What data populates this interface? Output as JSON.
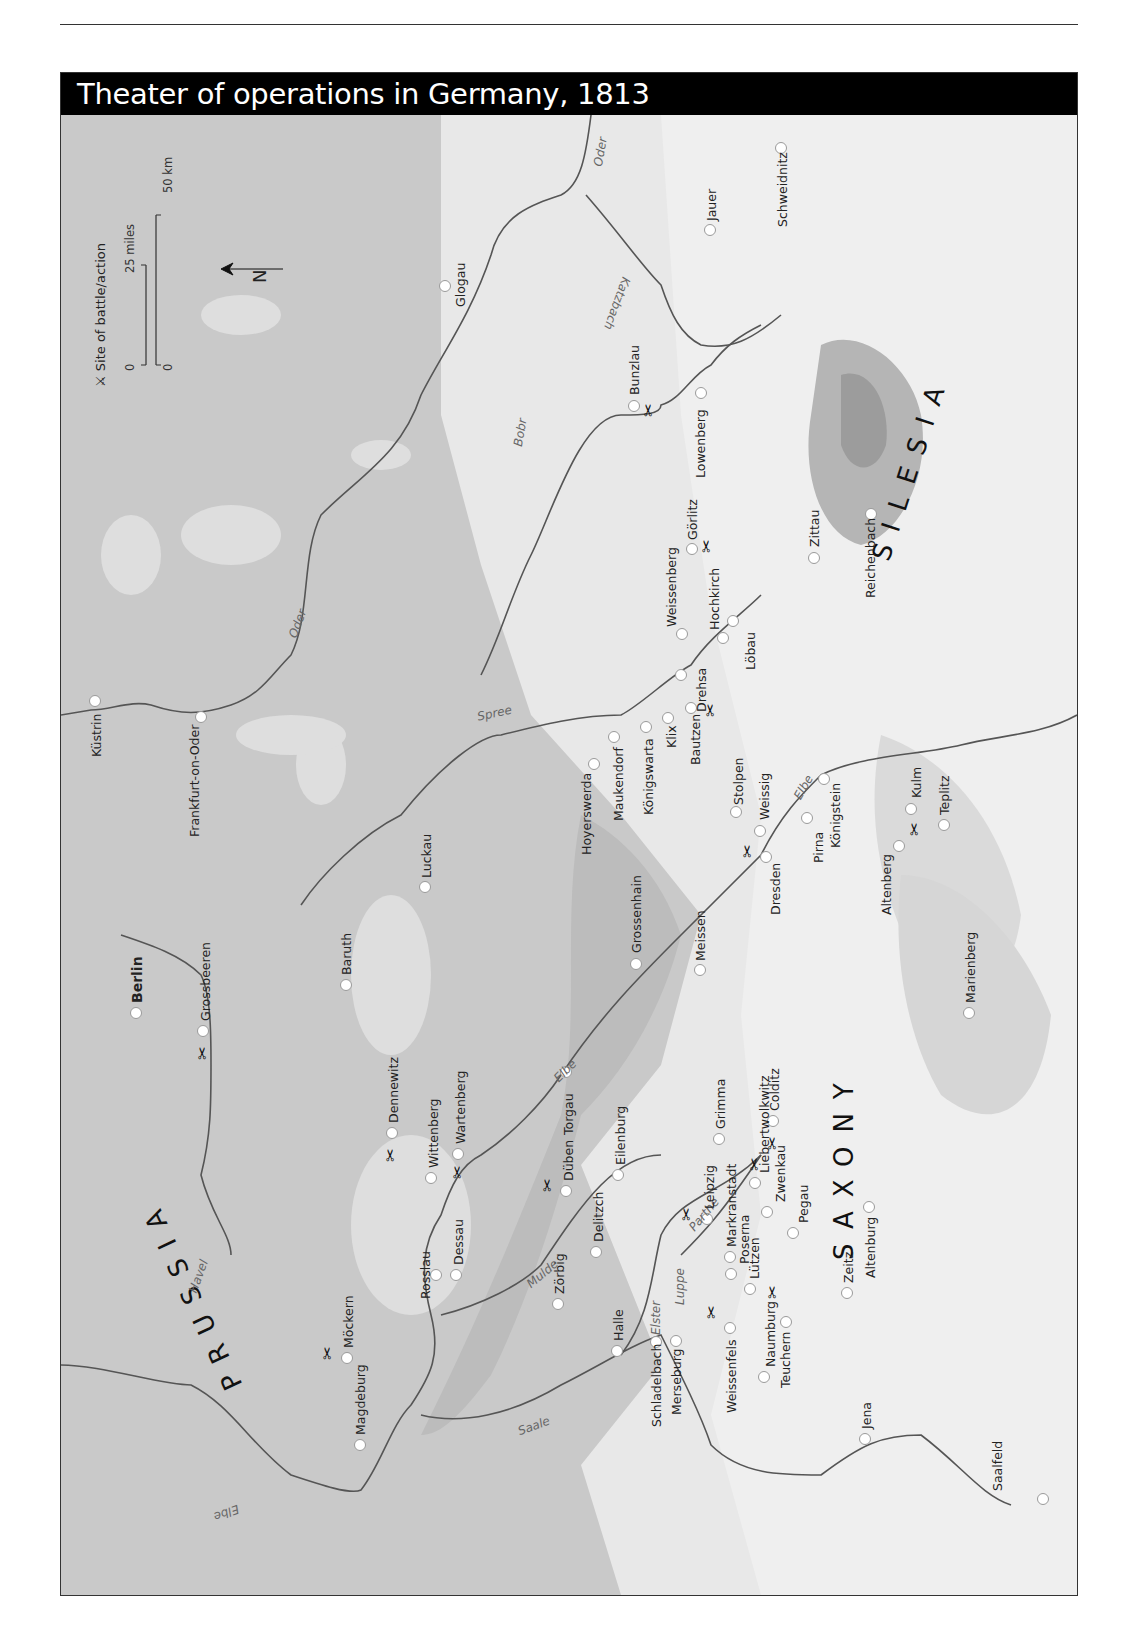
{
  "page": {
    "header_rule": true
  },
  "map": {
    "title": "Theater of operations in Germany, 1813",
    "legend": {
      "battle_symbol": "⚔",
      "battle_label": "Site of battle/action",
      "scale_miles_zero": "0",
      "scale_miles_label": "25 miles",
      "scale_km_zero": "0",
      "scale_km_label": "50 km",
      "north_label": "N"
    },
    "regions": [
      {
        "name": "PRUSSIA"
      },
      {
        "name": "SAXONY"
      },
      {
        "name": "SILESIA"
      }
    ],
    "rivers": [
      {
        "name": "Oder"
      },
      {
        "name": "Oder"
      },
      {
        "name": "Katzbach"
      },
      {
        "name": "Bobr"
      },
      {
        "name": "Spree"
      },
      {
        "name": "Elbe"
      },
      {
        "name": "Elbe"
      },
      {
        "name": "Elbe"
      },
      {
        "name": "Havel"
      },
      {
        "name": "Mulde"
      },
      {
        "name": "Parthe"
      },
      {
        "name": "Luppe"
      },
      {
        "name": "Elster"
      },
      {
        "name": "Saale"
      }
    ],
    "towns": [
      {
        "name": "Küstrin",
        "battle": false
      },
      {
        "name": "Frankfurt-on-Oder",
        "battle": false
      },
      {
        "name": "Glogau",
        "battle": false
      },
      {
        "name": "Jauer",
        "battle": false
      },
      {
        "name": "Schweidnitz",
        "battle": false
      },
      {
        "name": "Bunzlau",
        "battle": true
      },
      {
        "name": "Lowenberg",
        "battle": false
      },
      {
        "name": "Görlitz",
        "battle": true
      },
      {
        "name": "Weissenberg",
        "battle": false
      },
      {
        "name": "Hochkirch",
        "battle": false
      },
      {
        "name": "Löbau",
        "battle": false
      },
      {
        "name": "Drehsa",
        "battle": false
      },
      {
        "name": "Zittau",
        "battle": false
      },
      {
        "name": "Reichenbach",
        "battle": false
      },
      {
        "name": "Bautzen",
        "battle": true
      },
      {
        "name": "Klix",
        "battle": false
      },
      {
        "name": "Königswarta",
        "battle": false
      },
      {
        "name": "Maukendorf",
        "battle": false
      },
      {
        "name": "Hoyerswerda",
        "battle": false
      },
      {
        "name": "Stolpen",
        "battle": false
      },
      {
        "name": "Weissig",
        "battle": false
      },
      {
        "name": "Dresden",
        "battle": true
      },
      {
        "name": "Pirna",
        "battle": false
      },
      {
        "name": "Königstein",
        "battle": false
      },
      {
        "name": "Altenberg",
        "battle": false
      },
      {
        "name": "Kulm",
        "battle": true
      },
      {
        "name": "Teplitz",
        "battle": false
      },
      {
        "name": "Luckau",
        "battle": false
      },
      {
        "name": "Grossenhain",
        "battle": false
      },
      {
        "name": "Meissen",
        "battle": false
      },
      {
        "name": "Marienberg",
        "battle": false
      },
      {
        "name": "Berlin",
        "battle": false,
        "capital": true
      },
      {
        "name": "Grossbeeren",
        "battle": true
      },
      {
        "name": "Baruth",
        "battle": false
      },
      {
        "name": "Dennewitz",
        "battle": true
      },
      {
        "name": "Wittenberg",
        "battle": false
      },
      {
        "name": "Wartenberg",
        "battle": true
      },
      {
        "name": "Torgau",
        "battle": false
      },
      {
        "name": "Düben",
        "battle": true
      },
      {
        "name": "Eilenburg",
        "battle": false
      },
      {
        "name": "Grimma",
        "battle": false
      },
      {
        "name": "Colditz",
        "battle": true
      },
      {
        "name": "Delitzch",
        "battle": false
      },
      {
        "name": "Leipzig",
        "battle": true
      },
      {
        "name": "Markranstadt",
        "battle": false
      },
      {
        "name": "Liebertwolkwitz",
        "battle": true
      },
      {
        "name": "Zwenkau",
        "battle": false
      },
      {
        "name": "Pegau",
        "battle": false
      },
      {
        "name": "Poserna",
        "battle": false
      },
      {
        "name": "Lützen",
        "battle": true
      },
      {
        "name": "Zeitz",
        "battle": false
      },
      {
        "name": "Altenburg",
        "battle": false
      },
      {
        "name": "Zörbig",
        "battle": false
      },
      {
        "name": "Halle",
        "battle": false
      },
      {
        "name": "Schladelbach",
        "battle": false
      },
      {
        "name": "Merseburg",
        "battle": false
      },
      {
        "name": "Weissenfels",
        "battle": true
      },
      {
        "name": "Naumburg",
        "battle": false
      },
      {
        "name": "Teuchern",
        "battle": false
      },
      {
        "name": "Jena",
        "battle": false
      },
      {
        "name": "Saalfeld",
        "battle": false
      },
      {
        "name": "Rosslau",
        "battle": false
      },
      {
        "name": "Dessau",
        "battle": false
      },
      {
        "name": "Möckern",
        "battle": true
      },
      {
        "name": "Magdeburg",
        "battle": false
      }
    ],
    "colors": {
      "lowland": "#c9c9c9",
      "upland": "#e6e6e6",
      "highland": "#f2f2f2",
      "mountain": "#a9a9a9",
      "river": "#555555",
      "title_bg": "#000000",
      "title_fg": "#ffffff"
    }
  }
}
